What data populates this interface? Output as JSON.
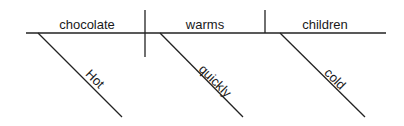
{
  "diagram": {
    "type": "sentence-diagram",
    "subject": {
      "word": "chocolate",
      "modifier": "Hot"
    },
    "verb": {
      "word": "warms",
      "modifier": "quickly"
    },
    "object": {
      "word": "children",
      "modifier": "cold"
    },
    "colors": {
      "ink": "#222222",
      "background": "#ffffff"
    }
  }
}
